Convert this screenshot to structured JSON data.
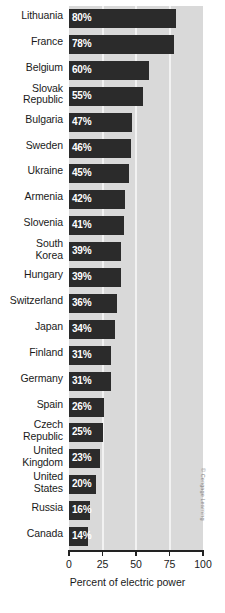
{
  "chart_data": {
    "type": "bar",
    "orientation": "horizontal",
    "title": "",
    "xlabel": "Percent of electric power",
    "ylabel": "",
    "xlim": [
      0,
      100
    ],
    "xticks": [
      0,
      25,
      50,
      75,
      100
    ],
    "xtick_labels": [
      "0",
      "25",
      "50",
      "75",
      "100"
    ],
    "grid": true,
    "grid_axis": "x",
    "legend": false,
    "categories": [
      "Lithuania",
      "France",
      "Belgium",
      "Slovak\nRepublic",
      "Bulgaria",
      "Sweden",
      "Ukraine",
      "Armenia",
      "Slovenia",
      "South\nKorea",
      "Hungary",
      "Switzerland",
      "Japan",
      "Finland",
      "Germany",
      "Spain",
      "Czech\nRepublic",
      "United\nKingdom",
      "United\nStates",
      "Russia",
      "Canada"
    ],
    "values": [
      80,
      78,
      60,
      55,
      47,
      46,
      45,
      42,
      41,
      39,
      39,
      36,
      34,
      31,
      31,
      26,
      25,
      23,
      20,
      16,
      14
    ],
    "value_labels": [
      "80%",
      "78%",
      "60%",
      "55%",
      "47%",
      "46%",
      "45%",
      "42%",
      "41%",
      "39%",
      "39%",
      "36%",
      "34%",
      "31%",
      "31%",
      "26%",
      "25%",
      "23%",
      "20%",
      "16%",
      "14%"
    ],
    "bars": [
      {
        "label": "Lithuania",
        "lines": [
          "Lithuania"
        ],
        "value": 80,
        "value_label": "80%"
      },
      {
        "label": "France",
        "lines": [
          "France"
        ],
        "value": 78,
        "value_label": "78%"
      },
      {
        "label": "Belgium",
        "lines": [
          "Belgium"
        ],
        "value": 60,
        "value_label": "60%"
      },
      {
        "label": "Slovak Republic",
        "lines": [
          "Slovak",
          "Republic"
        ],
        "value": 55,
        "value_label": "55%"
      },
      {
        "label": "Bulgaria",
        "lines": [
          "Bulgaria"
        ],
        "value": 47,
        "value_label": "47%"
      },
      {
        "label": "Sweden",
        "lines": [
          "Sweden"
        ],
        "value": 46,
        "value_label": "46%"
      },
      {
        "label": "Ukraine",
        "lines": [
          "Ukraine"
        ],
        "value": 45,
        "value_label": "45%"
      },
      {
        "label": "Armenia",
        "lines": [
          "Armenia"
        ],
        "value": 42,
        "value_label": "42%"
      },
      {
        "label": "Slovenia",
        "lines": [
          "Slovenia"
        ],
        "value": 41,
        "value_label": "41%"
      },
      {
        "label": "South Korea",
        "lines": [
          "South",
          "Korea"
        ],
        "value": 39,
        "value_label": "39%"
      },
      {
        "label": "Hungary",
        "lines": [
          "Hungary"
        ],
        "value": 39,
        "value_label": "39%"
      },
      {
        "label": "Switzerland",
        "lines": [
          "Switzerland"
        ],
        "value": 36,
        "value_label": "36%"
      },
      {
        "label": "Japan",
        "lines": [
          "Japan"
        ],
        "value": 34,
        "value_label": "34%"
      },
      {
        "label": "Finland",
        "lines": [
          "Finland"
        ],
        "value": 31,
        "value_label": "31%"
      },
      {
        "label": "Germany",
        "lines": [
          "Germany"
        ],
        "value": 31,
        "value_label": "31%"
      },
      {
        "label": "Spain",
        "lines": [
          "Spain"
        ],
        "value": 26,
        "value_label": "26%"
      },
      {
        "label": "Czech Republic",
        "lines": [
          "Czech",
          "Republic"
        ],
        "value": 25,
        "value_label": "25%"
      },
      {
        "label": "United Kingdom",
        "lines": [
          "United",
          "Kingdom"
        ],
        "value": 23,
        "value_label": "23%"
      },
      {
        "label": "United States",
        "lines": [
          "United",
          "States"
        ],
        "value": 20,
        "value_label": "20%"
      },
      {
        "label": "Russia",
        "lines": [
          "Russia"
        ],
        "value": 16,
        "value_label": "16%"
      },
      {
        "label": "Canada",
        "lines": [
          "Canada"
        ],
        "value": 14,
        "value_label": "14%"
      }
    ],
    "colors": {
      "bar": "#2b2b2b",
      "plot_background": "#d9d9d9",
      "gridline": "#f2f2f2",
      "value_text": "#ffffff",
      "axis": "#222222",
      "text": "#1a1a1a",
      "credit_text": "#8a8a8a",
      "page_background": "#ffffff"
    }
  },
  "credit": "© Cengage Learning"
}
